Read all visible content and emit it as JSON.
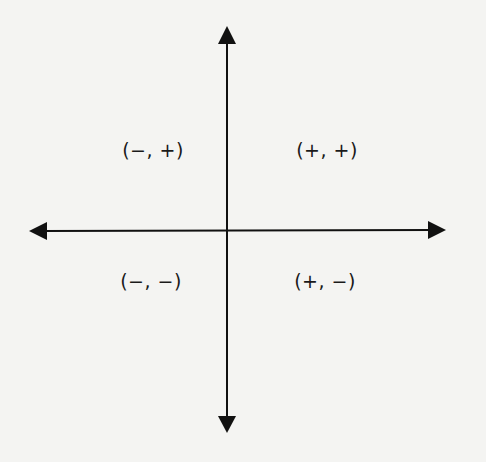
{
  "diagram": {
    "type": "coordinate-plane-quadrant-signs",
    "axis_color": "#111111",
    "background": "#f4f4f2",
    "quadrants": [
      {
        "name": "quadrant-2",
        "label": "(−, +)",
        "x": 153,
        "y": 150
      },
      {
        "name": "quadrant-1",
        "label": "(+, +)",
        "x": 327,
        "y": 150
      },
      {
        "name": "quadrant-3",
        "label": "(−, −)",
        "x": 151,
        "y": 281
      },
      {
        "name": "quadrant-4",
        "label": "(+, −)",
        "x": 325,
        "y": 281
      }
    ]
  }
}
